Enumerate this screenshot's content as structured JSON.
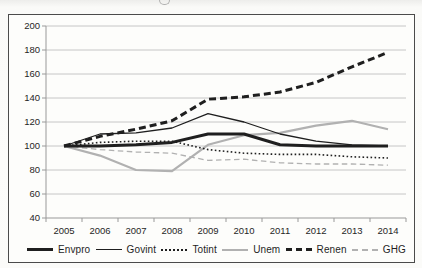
{
  "figure": {
    "border_color": "#4b4b4b",
    "background": "#fcfcfa",
    "grid_color": "#c6c6c6",
    "axis_color": "#999999",
    "text_color": "#262626"
  },
  "chart_data": {
    "type": "line",
    "title": "",
    "xlabel": "",
    "ylabel": "",
    "grid": true,
    "legend_position": "bottom",
    "categories": [
      "2005",
      "2006",
      "2007",
      "2008",
      "2009",
      "2010",
      "2011",
      "2012",
      "2013",
      "2014"
    ],
    "y_axis": {
      "min": 40,
      "max": 200,
      "step": 20,
      "ticks": [
        40,
        60,
        80,
        100,
        120,
        140,
        160,
        180,
        200
      ]
    },
    "series": [
      {
        "name": "Envpro",
        "color": "#1f1f1f",
        "line": "solid",
        "weight": "thick",
        "values": [
          100,
          100,
          101,
          103,
          110,
          110,
          101,
          100,
          100,
          100
        ]
      },
      {
        "name": "Govint",
        "color": "#1f1f1f",
        "line": "solid",
        "weight": "thin",
        "values": [
          100,
          110,
          111,
          115,
          127,
          120,
          110,
          104,
          101,
          100
        ]
      },
      {
        "name": "Totint",
        "color": "#1f1f1f",
        "line": "dotted",
        "weight": "thin",
        "values": [
          100,
          103,
          104,
          104,
          97,
          94,
          93,
          93,
          91,
          90
        ]
      },
      {
        "name": "Unem",
        "color": "#b1b1b1",
        "line": "solid",
        "weight": "medium",
        "values": [
          100,
          92,
          80,
          79,
          101,
          109,
          111,
          117,
          121,
          114
        ]
      },
      {
        "name": "Renen",
        "color": "#1f1f1f",
        "line": "dashed",
        "weight": "thick",
        "values": [
          100,
          108,
          114,
          121,
          139,
          141,
          145,
          153,
          166,
          178
        ]
      },
      {
        "name": "GHG",
        "color": "#b1b1b1",
        "line": "dashed",
        "weight": "thin",
        "values": [
          100,
          97,
          95,
          94,
          88,
          89,
          86,
          85,
          85,
          84
        ]
      }
    ]
  }
}
